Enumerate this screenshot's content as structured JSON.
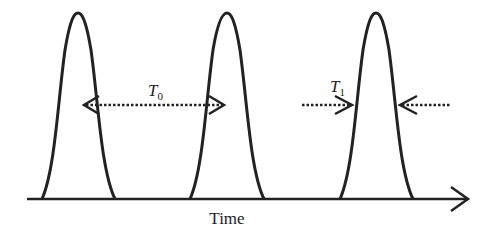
{
  "diagram": {
    "type": "pulse-train",
    "axis": {
      "label": "Time",
      "x_start": 27,
      "x_end": 469,
      "y": 199
    },
    "pulses": [
      {
        "peak_x": 78,
        "peak_y": 13,
        "base_left": 42,
        "base_right": 115
      },
      {
        "peak_x": 227,
        "peak_y": 13,
        "base_left": 190,
        "base_right": 264
      },
      {
        "peak_x": 376,
        "peak_y": 13,
        "base_left": 340,
        "base_right": 413
      }
    ],
    "annotations": [
      {
        "id": "T0",
        "symbol": "T",
        "subscript": "0",
        "meaning": "pulse period (peak-to-peak spacing)"
      },
      {
        "id": "T1",
        "symbol": "T",
        "subscript": "1",
        "meaning": "pulse width"
      }
    ],
    "colors": {
      "stroke": "#222222",
      "background": "#ffffff"
    }
  }
}
